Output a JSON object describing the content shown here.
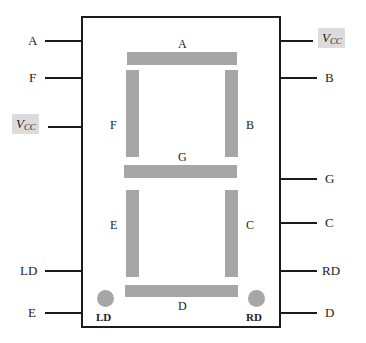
{
  "diagram": {
    "colors": {
      "outline": "#1b1b1b",
      "segment_fill": "#a6a6a6",
      "vcc_highlight": "#dcdcdc",
      "background": "#ffffff"
    },
    "left_pins": [
      {
        "label": "A",
        "highlight": false
      },
      {
        "label": "F",
        "highlight": false
      },
      {
        "label": "VCC",
        "highlight": true,
        "base": "V",
        "sub": "CC"
      },
      {
        "label": "LD",
        "highlight": false
      },
      {
        "label": "E",
        "highlight": false
      }
    ],
    "right_pins": [
      {
        "label": "VCC",
        "highlight": true,
        "base": "V",
        "sub": "CC"
      },
      {
        "label": "B",
        "highlight": false
      },
      {
        "label": "G",
        "highlight": false
      },
      {
        "label": "C",
        "highlight": false
      },
      {
        "label": "RD",
        "highlight": false
      },
      {
        "label": "D",
        "highlight": false
      }
    ],
    "segments": [
      {
        "id": "A",
        "label": "A",
        "orientation": "horizontal"
      },
      {
        "id": "B",
        "label": "B",
        "orientation": "vertical"
      },
      {
        "id": "C",
        "label": "C",
        "orientation": "vertical"
      },
      {
        "id": "D",
        "label": "D",
        "orientation": "horizontal"
      },
      {
        "id": "E",
        "label": "E",
        "orientation": "vertical"
      },
      {
        "id": "F",
        "label": "F",
        "orientation": "vertical"
      },
      {
        "id": "G",
        "label": "G",
        "orientation": "horizontal"
      }
    ],
    "decimal_points": [
      {
        "id": "LD",
        "label": "LD",
        "side": "left"
      },
      {
        "id": "RD",
        "label": "RD",
        "side": "right"
      }
    ]
  }
}
